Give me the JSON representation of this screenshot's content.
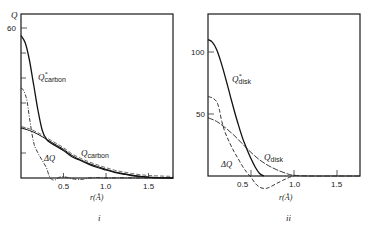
{
  "chart_data": [
    {
      "panel_label": "i",
      "type": "line",
      "title": "",
      "xlabel": "r(Å)",
      "ylabel": "Q",
      "xlim": [
        0,
        1.79
      ],
      "ylim": [
        0,
        65
      ],
      "grid": false,
      "x_ticks": [
        0.5,
        1.0,
        1.5
      ],
      "x_tick_labels": [
        "0.5",
        "1.0",
        "1.5"
      ],
      "y_ticks": [
        10,
        20,
        30,
        40,
        50,
        60
      ],
      "y_tick_labels": [
        "",
        "",
        "",
        "",
        "",
        "60"
      ],
      "series": [
        {
          "name": "Q*carbon",
          "label_main": "Q",
          "label_sup": "*",
          "label_sub": "carbon",
          "style": "solid",
          "x": [
            0,
            0.05,
            0.1,
            0.15,
            0.2,
            0.25,
            0.3,
            0.35,
            0.4,
            0.5,
            0.6,
            0.7,
            0.8,
            0.9,
            1.0,
            1.1,
            1.2,
            1.3,
            1.4,
            1.5,
            1.6,
            1.79
          ],
          "y": [
            57,
            54,
            47,
            37,
            27,
            19,
            15.5,
            14,
            13,
            11,
            8.5,
            7,
            5.5,
            4.2,
            3.2,
            2.3,
            1.6,
            1.0,
            0.6,
            0.3,
            0.1,
            0
          ]
        },
        {
          "name": "Qcarbon",
          "label_main": "Q",
          "label_sub": "carbon",
          "style": "solid-double",
          "x": [
            0,
            0.1,
            0.2,
            0.3,
            0.4,
            0.5,
            0.6,
            0.7,
            0.8,
            0.9,
            1.0,
            1.1,
            1.2,
            1.3,
            1.4,
            1.5,
            1.6,
            1.79
          ],
          "y": [
            20,
            19,
            17.5,
            15.5,
            13.5,
            11.5,
            9,
            7.3,
            5.8,
            4.6,
            3.5,
            2.5,
            1.8,
            1.2,
            0.7,
            0.4,
            0.2,
            0
          ]
        },
        {
          "name": "ΔQ",
          "label_main": "ΔQ",
          "style": "dash-dot",
          "x": [
            0,
            0.03,
            0.07,
            0.1,
            0.15,
            0.2,
            0.25,
            0.3,
            0.33,
            0.36,
            0.4,
            0.45,
            0.5,
            0.55,
            0.6,
            0.7,
            0.75,
            0.8,
            0.9,
            1.0,
            1.2,
            1.5,
            1.79
          ],
          "y": [
            36,
            35,
            31,
            24,
            14,
            10,
            7,
            4,
            1,
            -0.5,
            -0.8,
            0.3,
            0.5,
            0.2,
            -0.3,
            -0.6,
            -0.4,
            0,
            0.2,
            0,
            0.1,
            0,
            0
          ]
        }
      ]
    },
    {
      "panel_label": "ii",
      "type": "line",
      "title": "",
      "xlabel": "r(Å)",
      "ylabel": "",
      "xlim": [
        0,
        1.77
      ],
      "ylim": [
        0,
        130
      ],
      "grid": false,
      "x_ticks": [
        0.5,
        1.0,
        1.5
      ],
      "x_tick_labels": [
        "0.5",
        "1.0",
        "1.5"
      ],
      "y_ticks": [
        50,
        100
      ],
      "y_tick_labels": [
        "50",
        "100"
      ],
      "series": [
        {
          "name": "Q*disk",
          "label_main": "Q",
          "label_sup": "*",
          "label_sub": "disk",
          "style": "solid",
          "x": [
            0,
            0.05,
            0.1,
            0.15,
            0.2,
            0.25,
            0.3,
            0.35,
            0.4,
            0.45,
            0.5,
            0.55,
            0.6,
            0.65
          ],
          "y": [
            110,
            108,
            102,
            92,
            80,
            67,
            54,
            42,
            31,
            22,
            14,
            7,
            2,
            0
          ]
        },
        {
          "name": "Qdisk",
          "label_main": "Q",
          "label_sub": "disk",
          "style": "dashed-solid",
          "x": [
            0,
            0.1,
            0.2,
            0.3,
            0.4,
            0.5,
            0.6,
            0.7,
            0.8,
            0.9,
            1.0,
            1.2,
            1.5,
            1.77
          ],
          "y": [
            47,
            44,
            39,
            33,
            26,
            19,
            13,
            8.5,
            5,
            2.3,
            0.6,
            0,
            0,
            0
          ]
        },
        {
          "name": "ΔQ",
          "label_main": "ΔQ",
          "style": "dashed",
          "x": [
            0,
            0.05,
            0.1,
            0.13,
            0.16,
            0.2,
            0.25,
            0.3,
            0.35,
            0.4,
            0.45,
            0.5,
            0.55,
            0.6,
            0.65,
            0.7,
            0.8,
            0.9,
            0.95,
            1.0
          ],
          "y": [
            64,
            63,
            60,
            54,
            44,
            35,
            27,
            20,
            14,
            8,
            3,
            -1,
            -6,
            -9,
            -10,
            -9.5,
            -6,
            -2.5,
            -1,
            0
          ]
        }
      ]
    }
  ],
  "labels": {
    "panel_i": {
      "y_axis": "Q",
      "y_tick_60": "60",
      "x_axis": "r(Å)",
      "x_tick_05": "0.5",
      "x_tick_10": "1.0",
      "x_tick_15": "1.5",
      "caption": "i",
      "curve_qstar_main": "Q",
      "curve_qstar_sup": "*",
      "curve_qstar_sub": "carbon",
      "curve_q_main": "Q",
      "curve_q_sub": "carbon",
      "curve_dq": "ΔQ"
    },
    "panel_ii": {
      "y_tick_100": "100",
      "y_tick_50": "50",
      "x_axis": "r(Å)",
      "x_tick_05": "0.5",
      "x_tick_10": "1.0",
      "x_tick_15": "1.5",
      "caption": "ii",
      "curve_qstar_main": "Q",
      "curve_qstar_sup": "*",
      "curve_qstar_sub": "disk",
      "curve_q_main": "Q",
      "curve_q_sub": "disk",
      "curve_dq": "ΔQ"
    }
  }
}
